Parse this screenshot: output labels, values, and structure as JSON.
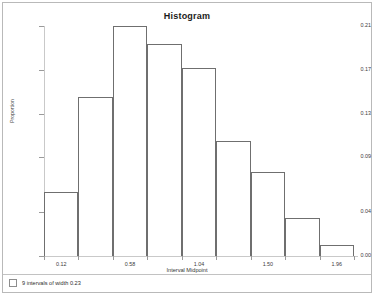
{
  "window": {
    "frame_border_color": "#b9b9b9",
    "background": "#ffffff"
  },
  "status_bar": {
    "checkbox_name": "intervals-checkbox",
    "text": "9 intervals of width 0.23"
  },
  "chart_data": {
    "type": "bar",
    "title": "Histogram",
    "xlabel": "Interval Midpoint",
    "ylabel": "Proportion",
    "grid": false,
    "legend": "none",
    "bar_style": "outline",
    "bar_outline_color": "#6f6f6f",
    "axis_color": "#c9c9c9",
    "categories": [
      "0.12",
      "0.35",
      "0.58",
      "0.81",
      "1.04",
      "1.27",
      "1.50",
      "1.73",
      "1.96"
    ],
    "values": [
      0.058,
      0.145,
      0.21,
      0.194,
      0.172,
      0.105,
      0.077,
      0.035,
      0.01
    ],
    "x": [
      0.12,
      0.35,
      0.58,
      0.81,
      1.04,
      1.27,
      1.5,
      1.73,
      1.96
    ],
    "bin_width": 0.23,
    "bin_count": 9,
    "xlim": [
      0.005,
      2.075
    ],
    "ylim": [
      0.0,
      0.21
    ],
    "ytick_labels": [
      "0.21",
      "0.17",
      "0.13",
      "0.09",
      "0.04",
      "0.00"
    ],
    "ytick_values": [
      0.21,
      0.17,
      0.13,
      0.09,
      0.04,
      0.0
    ],
    "xtick_labels": [
      "0.12",
      "0.58",
      "1.04",
      "1.50",
      "1.96"
    ],
    "xtick_values": [
      0.12,
      0.58,
      1.04,
      1.5,
      1.96
    ]
  }
}
